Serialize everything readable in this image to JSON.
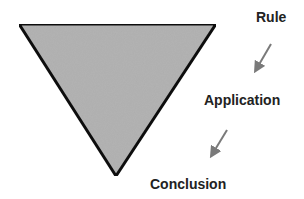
{
  "diagram": {
    "shape": "inverted-triangle",
    "fill_color": "#b3b3b3",
    "stroke_color": "#111111",
    "arrow_color": "#7a7a7a",
    "steps": [
      {
        "label": "Rule"
      },
      {
        "label": "Application"
      },
      {
        "label": "Conclusion"
      }
    ]
  }
}
